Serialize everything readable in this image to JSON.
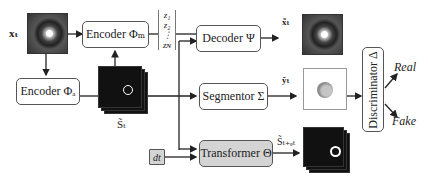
{
  "inputs": {
    "x_t": "xₜ",
    "dt": "dt"
  },
  "blocks": {
    "encoder_m": "Encoder Φₘ",
    "encoder_a": "Encoder Φₐ",
    "decoder": "Decoder Ψ",
    "segmentor": "Segmentor Σ",
    "transformer": "Transformer Θ",
    "discriminator": "Discriminator Δ"
  },
  "latent": {
    "z1": "z₁",
    "z2": "z₂",
    "dots": "⋮",
    "zN": "zɴ"
  },
  "outputs": {
    "x_hat": "x̃ₜ",
    "y_hat": "ỹₜ",
    "s_t": "S̃ₜ",
    "s_next": "S̃ₜ₊ₑₜ"
  },
  "labels": {
    "real": "Real",
    "fake": "Fake"
  }
}
